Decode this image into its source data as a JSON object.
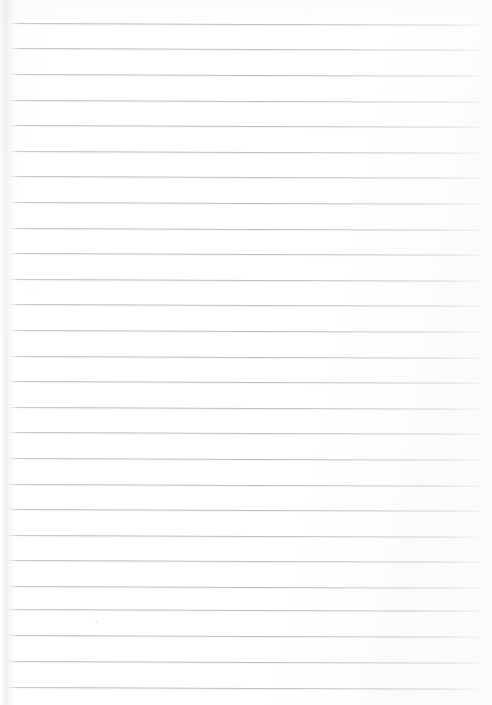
{
  "document": {
    "kind": "scanned-lined-paper",
    "title": "Blank ruled notebook page",
    "page_width": 492,
    "page_height": 705,
    "background_color": "#fefefe",
    "rule_color": "#bcbcc4",
    "margin_shadow_color": "#e4e4e9",
    "has_text": false,
    "body_text": "",
    "ruling": {
      "line_count": 27,
      "first_line_y": 23,
      "line_spacing": 25.6,
      "line_start_x": 10,
      "line_end_x": 486,
      "line_thickness": 1,
      "rotation_degrees": 0.22
    },
    "lines": [
      {
        "index": 1,
        "y": 23,
        "text": ""
      },
      {
        "index": 2,
        "y": 48,
        "text": ""
      },
      {
        "index": 3,
        "y": 74,
        "text": ""
      },
      {
        "index": 4,
        "y": 100,
        "text": ""
      },
      {
        "index": 5,
        "y": 125,
        "text": ""
      },
      {
        "index": 6,
        "y": 151,
        "text": ""
      },
      {
        "index": 7,
        "y": 176,
        "text": ""
      },
      {
        "index": 8,
        "y": 202,
        "text": ""
      },
      {
        "index": 9,
        "y": 228,
        "text": ""
      },
      {
        "index": 10,
        "y": 253,
        "text": ""
      },
      {
        "index": 11,
        "y": 279,
        "text": ""
      },
      {
        "index": 12,
        "y": 304,
        "text": ""
      },
      {
        "index": 13,
        "y": 330,
        "text": ""
      },
      {
        "index": 14,
        "y": 356,
        "text": ""
      },
      {
        "index": 15,
        "y": 381,
        "text": ""
      },
      {
        "index": 16,
        "y": 407,
        "text": ""
      },
      {
        "index": 17,
        "y": 432,
        "text": ""
      },
      {
        "index": 18,
        "y": 458,
        "text": ""
      },
      {
        "index": 19,
        "y": 484,
        "text": ""
      },
      {
        "index": 20,
        "y": 509,
        "text": ""
      },
      {
        "index": 21,
        "y": 535,
        "text": ""
      },
      {
        "index": 22,
        "y": 560,
        "text": ""
      },
      {
        "index": 23,
        "y": 586,
        "text": ""
      },
      {
        "index": 24,
        "y": 609,
        "text": ""
      },
      {
        "index": 25,
        "y": 635,
        "text": ""
      },
      {
        "index": 26,
        "y": 661,
        "text": ""
      },
      {
        "index": 27,
        "y": 687,
        "text": ""
      }
    ],
    "specks": [
      {
        "x": 95,
        "y": 620,
        "size": 3
      },
      {
        "x": 390,
        "y": 655,
        "size": 2
      },
      {
        "x": 308,
        "y": 11,
        "size": 2
      },
      {
        "x": 31,
        "y": 290,
        "size": 2
      }
    ]
  }
}
